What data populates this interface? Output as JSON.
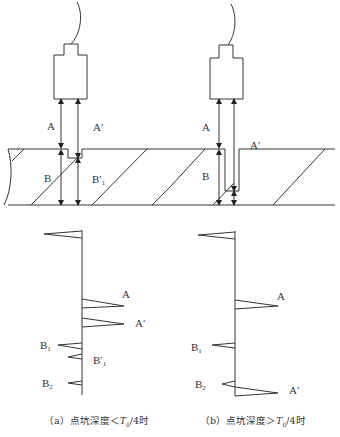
{
  "figure": {
    "panel_a": {
      "labels": {
        "A": "A",
        "A_prime": "A′",
        "B": "B",
        "B_prime_1": "B′",
        "B_prime_1_sub": "1"
      },
      "echo_labels": {
        "A": "A",
        "A_prime": "A′",
        "B1": "B",
        "B1_sub": "1",
        "B_prime_1": "B′",
        "B_prime_1_sub": "1",
        "B2": "B",
        "B2_sub": "2"
      },
      "caption": {
        "prefix": "（a）点坑深度＜",
        "T": "T",
        "T_sub": "0",
        "suffix": "/4时"
      }
    },
    "panel_b": {
      "labels": {
        "A": "A",
        "A_prime": "A′",
        "B": "B"
      },
      "echo_labels": {
        "A": "A",
        "B1": "B",
        "B1_sub": "1",
        "B2": "B",
        "B2_sub": "2",
        "A_prime": "A′"
      },
      "caption": {
        "prefix": "（b）点坑深度＞",
        "T": "T",
        "T_sub": "0",
        "suffix": "/4时"
      }
    }
  }
}
